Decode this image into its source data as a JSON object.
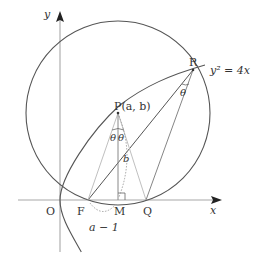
{
  "diagram": {
    "type": "geometry",
    "axes": {
      "x_label": "x",
      "y_label": "y",
      "origin_label": "O"
    },
    "curve_label": "y² = 4x",
    "points": {
      "P": "P(a, b)",
      "R": "R",
      "F": "F",
      "M": "M",
      "Q": "Q",
      "O": "O"
    },
    "angle_labels": {
      "left_at_P": "θ",
      "right_at_P": "θ",
      "at_R": "θ"
    },
    "segment_labels": {
      "PM": "b",
      "FM": "a − 1"
    },
    "colors": {
      "curve": "#555555",
      "axis": "#999999",
      "light_line": "#b0b0b0",
      "text": "#333333"
    }
  }
}
